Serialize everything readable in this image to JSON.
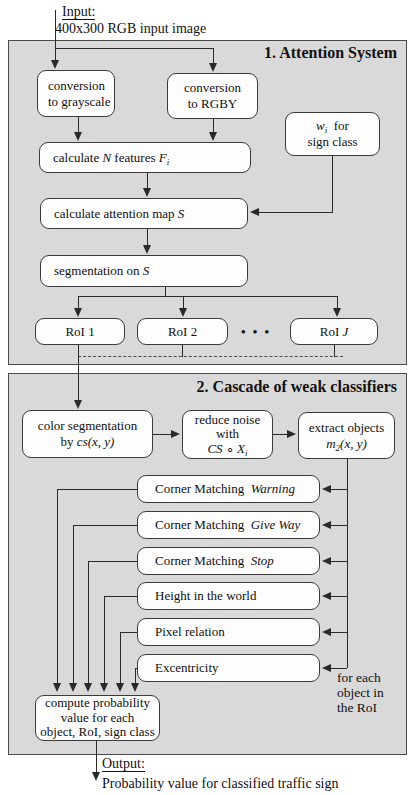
{
  "colors": {
    "panel_bg": "#d9d9d9",
    "panel_border": "#4a4a4a",
    "node_bg": "#fdfdfd",
    "node_border": "#3a3a3a",
    "line": "#2a2a2a",
    "text": "#111111"
  },
  "input": {
    "label": "Input:",
    "desc": "400x300 RGB input image"
  },
  "section1": {
    "title": "1. Attention System"
  },
  "section2": {
    "title": "2. Cascade of weak classifiers"
  },
  "nodes": {
    "grayscale": [
      [
        {
          "t": "conversion"
        }
      ],
      [
        {
          "t": "to grayscale"
        }
      ]
    ],
    "rgby": [
      [
        {
          "t": "conversion"
        }
      ],
      [
        {
          "t": "to RGBY"
        }
      ]
    ],
    "wi": [
      [
        {
          "t": "w",
          "c": "m"
        },
        {
          "t": "i",
          "c": "s"
        },
        {
          "t": "  for"
        }
      ],
      [
        {
          "t": "sign class"
        }
      ]
    ],
    "features": [
      [
        {
          "t": "calculate "
        },
        {
          "t": "N",
          "c": "m"
        },
        {
          "t": " features "
        },
        {
          "t": "F",
          "c": "m"
        },
        {
          "t": "i",
          "c": "s"
        }
      ]
    ],
    "attention_map": [
      [
        {
          "t": "calculate attention map "
        },
        {
          "t": "S",
          "c": "m"
        }
      ]
    ],
    "segmentation": [
      [
        {
          "t": "segmentation on "
        },
        {
          "t": "S",
          "c": "m"
        }
      ]
    ],
    "roi1": [
      [
        {
          "t": "RoI 1"
        }
      ]
    ],
    "roi2": [
      [
        {
          "t": "RoI 2"
        }
      ]
    ],
    "roij": [
      [
        {
          "t": "RoI "
        },
        {
          "t": "J",
          "c": "m"
        }
      ]
    ],
    "color_seg": [
      [
        {
          "t": "color segmentation"
        }
      ],
      [
        {
          "t": "by "
        },
        {
          "t": "cs(x, y)",
          "c": "m"
        }
      ]
    ],
    "reduce_noise": [
      [
        {
          "t": "reduce noise"
        }
      ],
      [
        {
          "t": "with"
        }
      ],
      [
        {
          "t": "CS",
          "c": "m"
        },
        {
          "t": " ∘ "
        },
        {
          "t": "X",
          "c": "m"
        },
        {
          "t": "i",
          "c": "s"
        }
      ]
    ],
    "extract_objects": [
      [
        {
          "t": "extract objects"
        }
      ],
      [
        {
          "t": "m",
          "c": "m"
        },
        {
          "t": "2",
          "c": "s"
        },
        {
          "t": "(x, y)",
          "c": "m"
        }
      ]
    ],
    "cm_warning": [
      [
        {
          "t": "Corner Matching  "
        },
        {
          "t": "Warning",
          "c": "i"
        }
      ]
    ],
    "cm_giveway": [
      [
        {
          "t": "Corner Matching  "
        },
        {
          "t": "Give Way",
          "c": "i"
        }
      ]
    ],
    "cm_stop": [
      [
        {
          "t": "Corner Matching  "
        },
        {
          "t": "Stop",
          "c": "i"
        }
      ]
    ],
    "height_world": [
      [
        {
          "t": "Height in the world"
        }
      ]
    ],
    "pixel_relation": [
      [
        {
          "t": "Pixel relation"
        }
      ]
    ],
    "excentricity": [
      [
        {
          "t": "Excentricity"
        }
      ]
    ],
    "compute": [
      [
        {
          "t": "compute probability"
        }
      ],
      [
        {
          "t": "value for each"
        }
      ],
      [
        {
          "t": "object, RoI, sign class"
        }
      ]
    ]
  },
  "annotations": {
    "dots": "• • •",
    "for_each": [
      [
        {
          "t": "for each"
        }
      ],
      [
        {
          "t": "object in"
        }
      ],
      [
        {
          "t": "the RoI"
        }
      ]
    ]
  },
  "output": {
    "label": "Output:",
    "desc": "Probability value for classified traffic sign"
  }
}
